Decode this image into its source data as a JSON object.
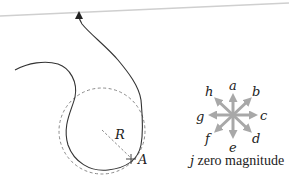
{
  "diagram": {
    "path_labels": {
      "radius": "R",
      "point": "A"
    },
    "compass": {
      "labels": {
        "a": "a",
        "b": "b",
        "c": "c",
        "d": "d",
        "e": "e",
        "f": "f",
        "g": "g",
        "h": "h"
      },
      "caption_letter": "j",
      "caption_text": " zero magnitude",
      "arrow_color": "#a8a8a8"
    },
    "colors": {
      "path": "#333333",
      "dashed_circle": "#8a8a8a",
      "top_line": "#cfcfcf"
    }
  }
}
